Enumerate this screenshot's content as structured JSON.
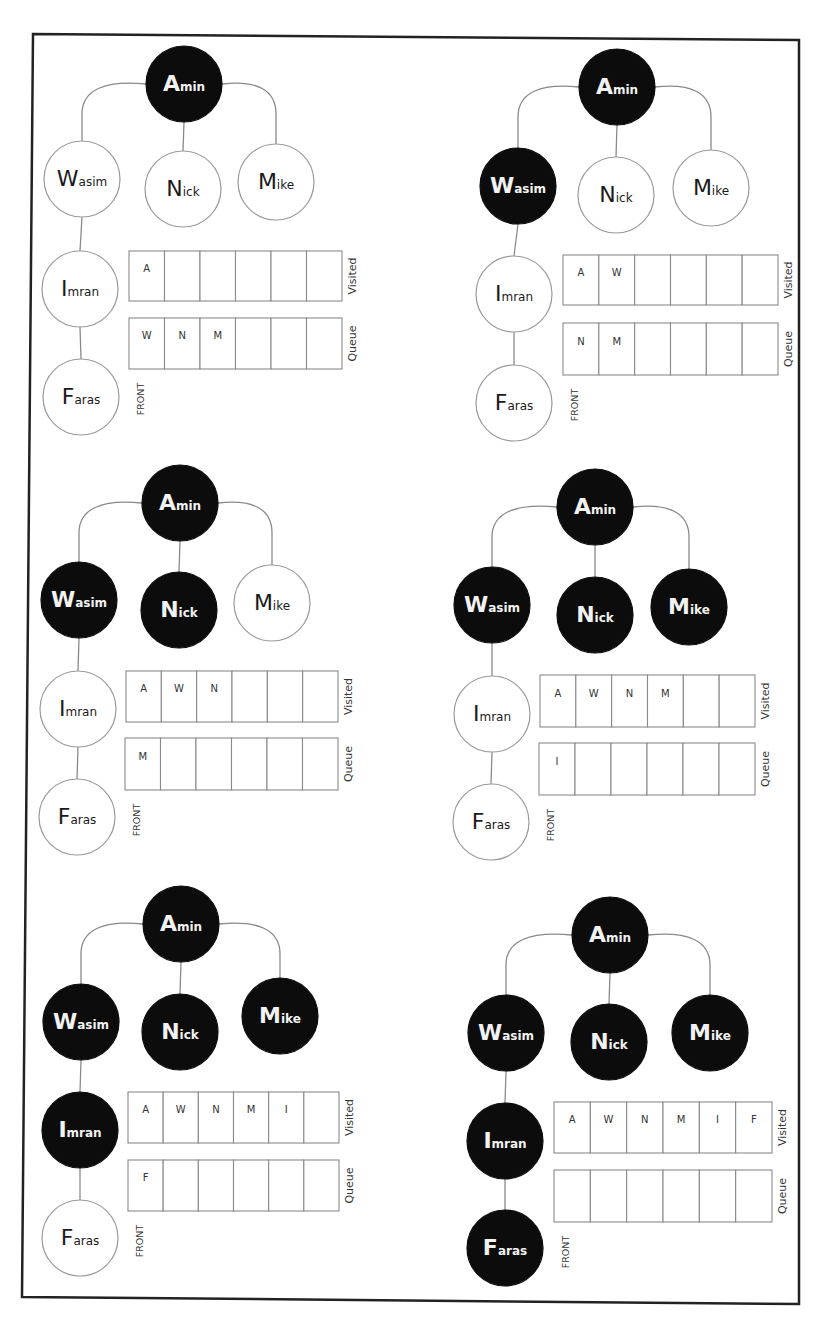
{
  "labels": {
    "visited": "Visited",
    "queue": "Queue",
    "front": "FRONT"
  },
  "colors": {
    "visited_node": "#0c0c0c",
    "unvisited_node": "#ffffff",
    "edge": "#8a8a8a",
    "frame": "#222222"
  },
  "nodes": [
    {
      "id": "A",
      "initial": "A",
      "rest": "min",
      "name": "Amin"
    },
    {
      "id": "W",
      "initial": "W",
      "rest": "asim",
      "name": "Wasim"
    },
    {
      "id": "N",
      "initial": "N",
      "rest": "ick",
      "name": "Nick"
    },
    {
      "id": "M",
      "initial": "M",
      "rest": "ike",
      "name": "Mike"
    },
    {
      "id": "I",
      "initial": "I",
      "rest": "mran",
      "name": "Imran"
    },
    {
      "id": "F",
      "initial": "F",
      "rest": "aras",
      "name": "Faras"
    }
  ],
  "edges": [
    [
      "A",
      "W"
    ],
    [
      "A",
      "N"
    ],
    [
      "A",
      "M"
    ],
    [
      "W",
      "I"
    ],
    [
      "I",
      "F"
    ]
  ],
  "steps": [
    {
      "step": 1,
      "visited_nodes": [
        "A"
      ],
      "visited_array": [
        "A",
        "",
        "",
        "",
        "",
        ""
      ],
      "queue_array": [
        "W",
        "N",
        "M",
        "",
        "",
        ""
      ]
    },
    {
      "step": 2,
      "visited_nodes": [
        "A",
        "W"
      ],
      "visited_array": [
        "A",
        "W",
        "",
        "",
        "",
        ""
      ],
      "queue_array": [
        "N",
        "M",
        "",
        "",
        "",
        ""
      ]
    },
    {
      "step": 3,
      "visited_nodes": [
        "A",
        "W",
        "N"
      ],
      "visited_array": [
        "A",
        "W",
        "N",
        "",
        "",
        ""
      ],
      "queue_array": [
        "M",
        "",
        "",
        "",
        "",
        ""
      ]
    },
    {
      "step": 4,
      "visited_nodes": [
        "A",
        "W",
        "N",
        "M"
      ],
      "visited_array": [
        "A",
        "W",
        "N",
        "M",
        "",
        ""
      ],
      "queue_array": [
        "I",
        "",
        "",
        "",
        "",
        ""
      ]
    },
    {
      "step": 5,
      "visited_nodes": [
        "A",
        "W",
        "N",
        "M",
        "I"
      ],
      "visited_array": [
        "A",
        "W",
        "N",
        "M",
        "I",
        ""
      ],
      "queue_array": [
        "F",
        "",
        "",
        "",
        "",
        ""
      ]
    },
    {
      "step": 6,
      "visited_nodes": [
        "A",
        "W",
        "N",
        "M",
        "I",
        "F"
      ],
      "visited_array": [
        "A",
        "W",
        "N",
        "M",
        "I",
        "F"
      ],
      "queue_array": [
        "",
        "",
        "",
        "",
        "",
        ""
      ]
    }
  ]
}
